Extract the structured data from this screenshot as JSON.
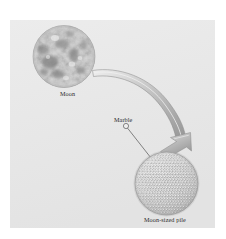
{
  "figure": {
    "caption_labels": {
      "moon": "Moon",
      "marble": "Marble",
      "pile": "Moon-sized pile"
    },
    "panel": {
      "background_color": "#e8e8e8",
      "x": 10,
      "y": 20,
      "width": 205,
      "height": 208
    },
    "page_background_color": "#ffffff"
  },
  "chart_data": {
    "type": "diagram",
    "title": "",
    "subtitle": "",
    "xlabel": "",
    "ylabel": "",
    "grid": false,
    "legend": "none",
    "elements": [
      {
        "name": "moon-sphere",
        "label": "Moon",
        "shape": "sphere",
        "center_x": 64,
        "center_y": 56,
        "radius": 31,
        "fill": "#cccccc",
        "texture": "cratered-maria"
      },
      {
        "name": "marble-callout",
        "label": "Marble",
        "shape": "circle-outline",
        "center_x": 126,
        "center_y": 126,
        "radius": 2.6,
        "fill": "none",
        "stroke": "#3a3a3a"
      },
      {
        "name": "pile-sphere",
        "label": "Moon-sized pile",
        "shape": "sphere-of-marbles",
        "center_x": 166,
        "center_y": 183,
        "radius": 31,
        "fill": "#d2d2d2",
        "marble_rows": 23,
        "marble_count_approx": 430
      },
      {
        "name": "transform-arrow",
        "label": "",
        "shape": "curved-arrow",
        "from_x": 93,
        "from_y": 72,
        "to_x": 161,
        "to_y": 152,
        "fill": "#b5b5b5",
        "stroke": "#8c8c8c"
      },
      {
        "name": "marble-leader-line",
        "label": "",
        "shape": "line",
        "from_x": 128,
        "from_y": 129,
        "to_x": 153,
        "to_y": 160,
        "stroke": "#3a3a3a"
      }
    ],
    "colors": {
      "panel_background": "#e8e8e8",
      "moon_light": "#e6e6e6",
      "moon_dark": "#8f8f8f",
      "arrow_fill": "#b5b5b5",
      "arrow_stroke": "#8c8c8c",
      "marble_outline": "#7a7a7a",
      "label_text": "#2b2b2b"
    }
  }
}
